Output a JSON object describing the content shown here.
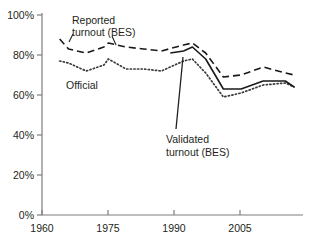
{
  "chart_data": {
    "type": "line",
    "title": "",
    "xlabel": "",
    "ylabel": "",
    "xlim": [
      1960,
      2019
    ],
    "ylim": [
      0,
      100
    ],
    "grid": false,
    "legend": "inline-annotations",
    "x_ticks": [
      "1960",
      "1975",
      "1990",
      "2005"
    ],
    "x_tick_values": [
      1960,
      1975,
      1990,
      2005
    ],
    "y_ticks": [
      "0%",
      "20%",
      "40%",
      "60%",
      "80%",
      "100%"
    ],
    "y_tick_values": [
      0,
      20,
      40,
      60,
      80,
      100
    ],
    "series": [
      {
        "name": "Reported turnout (BES)",
        "style": "dashed",
        "color": "#1a1a1a",
        "x": [
          1964,
          1966,
          1970,
          1974,
          1975,
          1979,
          1983,
          1987,
          1992,
          1994,
          1997,
          2001,
          2005,
          2010,
          2015,
          2017
        ],
        "values": [
          88,
          83,
          81,
          84,
          86,
          84,
          83,
          82,
          85,
          86,
          81,
          69,
          70,
          74,
          71,
          70
        ]
      },
      {
        "name": "Official",
        "style": "dotted",
        "color": "#3a3a3a",
        "x": [
          1964,
          1966,
          1970,
          1974,
          1975,
          1979,
          1983,
          1987,
          1992,
          1994,
          1997,
          2001,
          2005,
          2010,
          2015,
          2017
        ],
        "values": [
          77,
          76,
          72,
          75,
          78,
          73,
          73,
          72,
          77,
          78,
          71,
          59,
          61,
          65,
          66,
          64
        ]
      },
      {
        "name": "Validated turnout (BES)",
        "style": "solid",
        "color": "#1a1a1a",
        "x": [
          1989,
          1992,
          1994,
          1997,
          2001,
          2005,
          2010,
          2015,
          2017
        ],
        "values": [
          81,
          82,
          84,
          78,
          63,
          63,
          67,
          67,
          64
        ]
      }
    ],
    "annotations": [
      {
        "id": "reported-label",
        "line1": "Reported",
        "line2": "turnout (BES)",
        "target_series": "Reported turnout (BES)"
      },
      {
        "id": "official-label",
        "line1": "Official",
        "line2": "",
        "target_series": "Official"
      },
      {
        "id": "validated-label",
        "line1": "Validated",
        "line2": "turnout (BES)",
        "target_series": "Validated turnout (BES)"
      }
    ],
    "axis_color": "#7d7d7d"
  }
}
